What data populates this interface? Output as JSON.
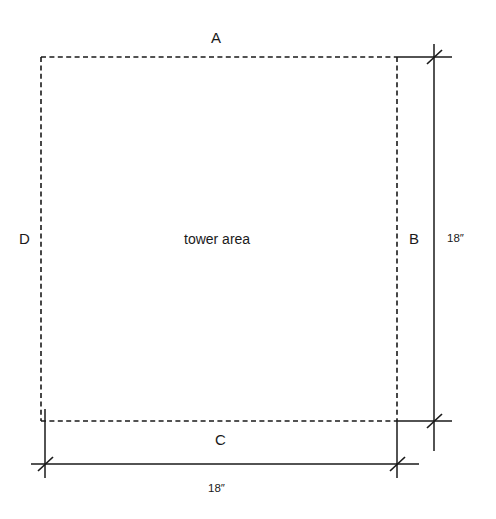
{
  "diagram": {
    "type": "dimensioned-plan-square",
    "area_label": "tower area",
    "side_labels": {
      "top": "A",
      "right": "B",
      "bottom": "C",
      "left": "D"
    },
    "dimensions": {
      "right_vertical": "18″",
      "bottom_horizontal": "18″"
    },
    "styles": {
      "outline_stroke": "#1a1a1a",
      "dimension_stroke": "#1a1a1a",
      "background": "#ffffff",
      "outline_style": "dashed",
      "tick_style": "architectural-slash"
    },
    "geometry": {
      "square_left": 41,
      "square_top": 57,
      "square_right": 397,
      "square_bottom": 421,
      "vertical_dim_x": 434,
      "horizontal_dim_y": 464
    }
  }
}
